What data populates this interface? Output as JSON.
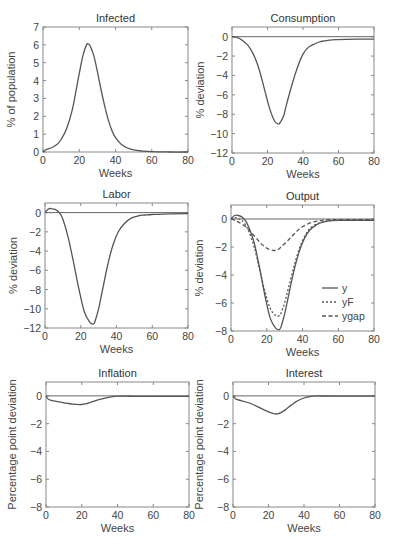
{
  "chart_data": [
    {
      "id": "infected",
      "type": "line",
      "title": "Infected",
      "xlabel": "Weeks",
      "ylabel": "% of population",
      "xlim": [
        0,
        80
      ],
      "ylim": [
        0,
        7
      ],
      "xticks": [
        0,
        20,
        40,
        60,
        80
      ],
      "yticks": [
        0,
        1,
        2,
        3,
        4,
        5,
        6,
        7
      ],
      "zero_line": false,
      "box": {
        "x": 43,
        "y": 27,
        "w": 145,
        "h": 125
      },
      "series": [
        {
          "name": "Infected",
          "style": "solid",
          "x": [
            0,
            2,
            5,
            8,
            10,
            13,
            16,
            18,
            20,
            22,
            24,
            25,
            26,
            28,
            30,
            32,
            34,
            36,
            38,
            40,
            43,
            46,
            50,
            55,
            60,
            70,
            80
          ],
          "y": [
            0.0,
            0.15,
            0.25,
            0.45,
            0.7,
            1.3,
            2.3,
            3.3,
            4.4,
            5.4,
            6.0,
            6.05,
            5.95,
            5.4,
            4.5,
            3.5,
            2.6,
            1.8,
            1.2,
            0.8,
            0.45,
            0.25,
            0.12,
            0.05,
            0.02,
            0.0,
            0.0
          ]
        }
      ]
    },
    {
      "id": "consumption",
      "type": "line",
      "title": "Consumption",
      "xlabel": "Weeks",
      "ylabel": "% deviation",
      "xlim": [
        0,
        80
      ],
      "ylim": [
        -12,
        1
      ],
      "xticks": [
        0,
        20,
        40,
        60,
        80
      ],
      "yticks": [
        0,
        -2,
        -4,
        -6,
        -8,
        -10,
        -12
      ],
      "zero_line": true,
      "box": {
        "x": 232,
        "y": 27,
        "w": 142,
        "h": 126
      },
      "series": [
        {
          "name": "Consumption",
          "style": "solid",
          "x": [
            0,
            3,
            6,
            9,
            12,
            15,
            18,
            21,
            24,
            26,
            27,
            29,
            31,
            34,
            37,
            40,
            43,
            46,
            50,
            55,
            60,
            70,
            80
          ],
          "y": [
            0.0,
            -0.1,
            -0.4,
            -0.9,
            -1.8,
            -3.2,
            -5.2,
            -7.3,
            -8.7,
            -9.0,
            -8.9,
            -8.2,
            -6.8,
            -4.8,
            -3.1,
            -1.8,
            -1.1,
            -0.8,
            -0.5,
            -0.35,
            -0.3,
            -0.25,
            -0.25
          ]
        }
      ]
    },
    {
      "id": "labor",
      "type": "line",
      "title": "Labor",
      "xlabel": "Weeks",
      "ylabel": "% deviation",
      "xlim": [
        0,
        80
      ],
      "ylim": [
        -12,
        1
      ],
      "xticks": [
        0,
        20,
        40,
        60,
        80
      ],
      "yticks": [
        0,
        -2,
        -4,
        -6,
        -8,
        -10,
        -12
      ],
      "zero_line": true,
      "box": {
        "x": 45,
        "y": 203,
        "w": 143,
        "h": 125
      },
      "series": [
        {
          "name": "Labor",
          "style": "solid",
          "x": [
            0,
            2,
            4,
            6,
            8,
            10,
            13,
            16,
            19,
            22,
            25,
            27,
            28,
            30,
            32,
            35,
            38,
            41,
            44,
            48,
            52,
            56,
            60,
            70,
            80
          ],
          "y": [
            0.0,
            0.4,
            0.4,
            0.3,
            0.0,
            -0.7,
            -2.6,
            -5.2,
            -8.0,
            -10.3,
            -11.4,
            -11.6,
            -11.3,
            -10.0,
            -8.2,
            -5.5,
            -3.4,
            -2.0,
            -1.2,
            -0.6,
            -0.35,
            -0.25,
            -0.2,
            -0.12,
            -0.1
          ]
        }
      ]
    },
    {
      "id": "output",
      "type": "line",
      "title": "Output",
      "xlabel": "Weeks",
      "ylabel": "% deviation",
      "xlim": [
        0,
        80
      ],
      "ylim": [
        -8,
        1
      ],
      "xticks": [
        0,
        20,
        40,
        60,
        80
      ],
      "yticks": [
        0,
        -2,
        -4,
        -6,
        -8
      ],
      "zero_line": true,
      "legend": {
        "position": "lower right",
        "entries": [
          {
            "label": "y",
            "style": "solid"
          },
          {
            "label": "yF",
            "style": "dotted"
          },
          {
            "label": "ygap",
            "style": "dashed"
          }
        ]
      },
      "box": {
        "x": 231,
        "y": 205,
        "w": 143,
        "h": 126
      },
      "series": [
        {
          "name": "y",
          "style": "solid",
          "x": [
            0,
            2,
            4,
            6,
            8,
            10,
            13,
            16,
            19,
            22,
            25,
            27,
            28,
            30,
            32,
            35,
            38,
            41,
            44,
            48,
            52,
            56,
            60,
            70,
            80
          ],
          "y": [
            0.0,
            0.25,
            0.25,
            0.15,
            -0.1,
            -0.6,
            -1.7,
            -3.5,
            -5.5,
            -7.1,
            -7.8,
            -7.9,
            -7.7,
            -6.8,
            -5.6,
            -3.8,
            -2.4,
            -1.4,
            -0.8,
            -0.4,
            -0.2,
            -0.12,
            -0.1,
            -0.1,
            -0.1
          ]
        },
        {
          "name": "yF",
          "style": "dotted",
          "x": [
            0,
            2,
            4,
            6,
            8,
            10,
            13,
            16,
            19,
            22,
            25,
            27,
            28,
            30,
            32,
            35,
            38,
            41,
            44,
            48,
            52,
            56,
            60,
            70,
            80
          ],
          "y": [
            0.0,
            0.1,
            0.05,
            -0.1,
            -0.4,
            -0.9,
            -2.0,
            -3.6,
            -5.2,
            -6.4,
            -6.9,
            -6.9,
            -6.7,
            -6.0,
            -5.0,
            -3.5,
            -2.2,
            -1.3,
            -0.7,
            -0.35,
            -0.2,
            -0.12,
            -0.1,
            -0.1,
            -0.1
          ]
        },
        {
          "name": "ygap",
          "style": "dashed",
          "x": [
            0,
            3,
            6,
            9,
            12,
            15,
            18,
            21,
            24,
            26,
            28,
            31,
            34,
            37,
            40,
            44,
            48,
            52,
            56,
            60,
            70,
            80
          ],
          "y": [
            0.0,
            -0.15,
            -0.35,
            -0.65,
            -1.05,
            -1.5,
            -1.9,
            -2.15,
            -2.25,
            -2.2,
            -2.0,
            -1.65,
            -1.25,
            -0.85,
            -0.55,
            -0.3,
            -0.15,
            -0.08,
            -0.05,
            -0.05,
            -0.05,
            -0.05
          ]
        }
      ]
    },
    {
      "id": "inflation",
      "type": "line",
      "title": "Inflation",
      "xlabel": "Weeks",
      "ylabel": "Percentage point deviation",
      "xlim": [
        0,
        80
      ],
      "ylim": [
        -8,
        1
      ],
      "xticks": [
        0,
        20,
        40,
        60,
        80
      ],
      "yticks": [
        0,
        -2,
        -4,
        -6,
        -8
      ],
      "zero_line": true,
      "box": {
        "x": 46,
        "y": 382,
        "w": 143,
        "h": 125
      },
      "series": [
        {
          "name": "Inflation",
          "style": "solid",
          "x": [
            0,
            1,
            2,
            5,
            10,
            15,
            20,
            23,
            26,
            30,
            35,
            40,
            45,
            50,
            60,
            70,
            80
          ],
          "y": [
            0.0,
            -0.2,
            -0.28,
            -0.38,
            -0.5,
            -0.6,
            -0.62,
            -0.55,
            -0.42,
            -0.25,
            -0.1,
            -0.02,
            -0.02,
            -0.03,
            -0.03,
            -0.03,
            -0.03
          ]
        }
      ]
    },
    {
      "id": "interest",
      "type": "line",
      "title": "Interest",
      "xlabel": "Weeks",
      "ylabel": "Percentage point deviation",
      "xlim": [
        0,
        80
      ],
      "ylim": [
        -8,
        1
      ],
      "xticks": [
        0,
        20,
        40,
        60,
        80
      ],
      "yticks": [
        0,
        -2,
        -4,
        -6,
        -8
      ],
      "zero_line": true,
      "box": {
        "x": 233,
        "y": 382,
        "w": 142,
        "h": 125
      },
      "series": [
        {
          "name": "Interest",
          "style": "solid",
          "x": [
            0,
            1,
            2,
            5,
            10,
            15,
            20,
            23,
            25,
            27,
            30,
            33,
            36,
            40,
            45,
            50,
            60,
            70,
            80
          ],
          "y": [
            0.0,
            -0.15,
            -0.25,
            -0.35,
            -0.55,
            -0.85,
            -1.15,
            -1.28,
            -1.3,
            -1.2,
            -0.95,
            -0.65,
            -0.38,
            -0.15,
            -0.02,
            -0.01,
            -0.02,
            -0.02,
            -0.02
          ]
        }
      ]
    }
  ]
}
